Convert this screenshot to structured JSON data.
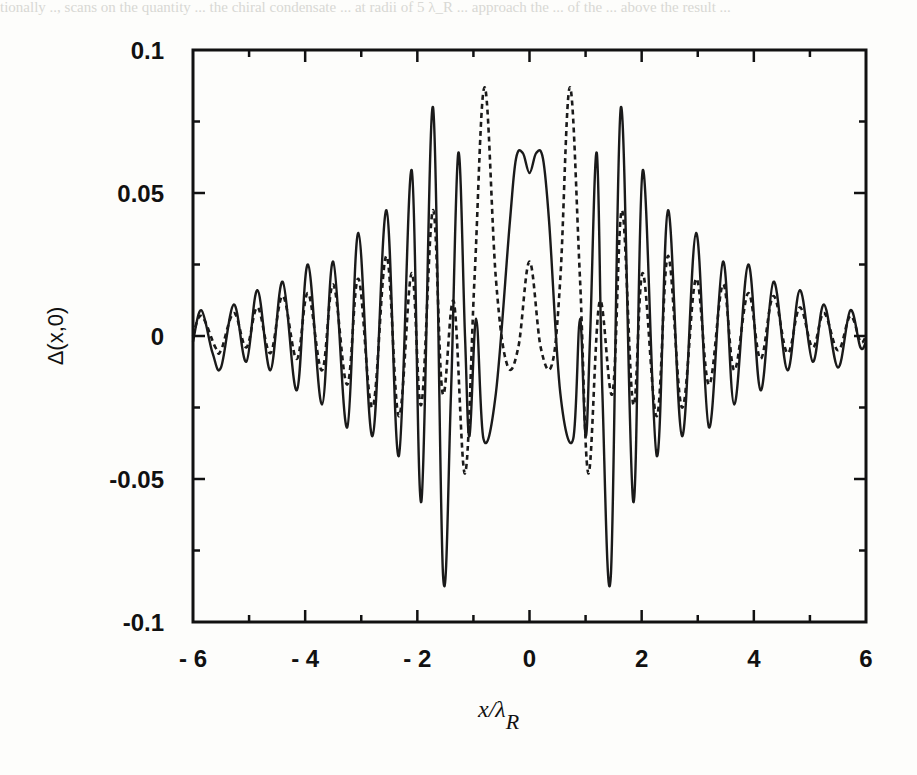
{
  "chart_data": {
    "type": "line",
    "title": "",
    "xlabel": "x/λ_R",
    "ylabel": "Δ(x,0)",
    "xlim": [
      -6,
      6
    ],
    "ylim": [
      -0.1,
      0.1
    ],
    "grid": false,
    "legend": null,
    "x_ticks": {
      "major": [
        -6,
        -4,
        -2,
        0,
        2,
        4,
        6
      ],
      "minor": [
        -5,
        -3,
        -1,
        1,
        3,
        5
      ],
      "labels": [
        "- 6",
        "- 4",
        "- 2",
        "0",
        "2",
        "4",
        "6"
      ]
    },
    "y_ticks": {
      "major": [
        0.1,
        0.05,
        0,
        -0.05,
        -0.1
      ],
      "minor": [
        0.075,
        0.025,
        -0.025,
        -0.075
      ],
      "labels": [
        "0.1",
        "0.05",
        "0",
        "-0.05",
        "-0.1"
      ]
    },
    "series": [
      {
        "name": "solid",
        "style": "solid",
        "points": [
          [
            -6.0,
            -0.002
          ],
          [
            -5.85,
            0.009
          ],
          [
            -5.65,
            -0.006
          ],
          [
            -5.5,
            -0.011
          ],
          [
            -5.27,
            0.011
          ],
          [
            -5.05,
            -0.009
          ],
          [
            -4.85,
            0.016
          ],
          [
            -4.62,
            -0.012
          ],
          [
            -4.4,
            0.019
          ],
          [
            -4.15,
            -0.019
          ],
          [
            -3.95,
            0.025
          ],
          [
            -3.7,
            -0.024
          ],
          [
            -3.5,
            0.026
          ],
          [
            -3.25,
            -0.032
          ],
          [
            -3.05,
            0.036
          ],
          [
            -2.8,
            -0.035
          ],
          [
            -2.55,
            0.044
          ],
          [
            -2.33,
            -0.042
          ],
          [
            -2.1,
            0.058
          ],
          [
            -1.93,
            -0.058
          ],
          [
            -1.72,
            0.08
          ],
          [
            -1.54,
            -0.084
          ],
          [
            -1.4,
            -0.02
          ],
          [
            -1.27,
            0.064
          ],
          [
            -1.15,
            0.0
          ],
          [
            -1.07,
            -0.035
          ],
          [
            -0.95,
            0.006
          ],
          [
            -0.82,
            -0.036
          ],
          [
            -0.6,
            -0.02
          ],
          [
            -0.35,
            0.04
          ],
          [
            -0.24,
            0.062
          ],
          [
            -0.12,
            0.064
          ],
          [
            0.0,
            0.057
          ],
          [
            0.12,
            0.064
          ],
          [
            0.24,
            0.062
          ],
          [
            0.35,
            0.04
          ],
          [
            0.55,
            -0.02
          ],
          [
            0.78,
            -0.036
          ],
          [
            0.9,
            0.006
          ],
          [
            1.0,
            -0.035
          ],
          [
            1.08,
            0.0
          ],
          [
            1.2,
            0.064
          ],
          [
            1.3,
            -0.02
          ],
          [
            1.45,
            -0.084
          ],
          [
            1.63,
            0.08
          ],
          [
            1.85,
            -0.058
          ],
          [
            2.02,
            0.058
          ],
          [
            2.27,
            -0.042
          ],
          [
            2.47,
            0.044
          ],
          [
            2.72,
            -0.035
          ],
          [
            2.97,
            0.036
          ],
          [
            3.2,
            -0.032
          ],
          [
            3.45,
            0.026
          ],
          [
            3.65,
            -0.024
          ],
          [
            3.9,
            0.025
          ],
          [
            4.12,
            -0.019
          ],
          [
            4.35,
            0.019
          ],
          [
            4.6,
            -0.012
          ],
          [
            4.82,
            0.016
          ],
          [
            5.05,
            -0.009
          ],
          [
            5.25,
            0.011
          ],
          [
            5.5,
            -0.011
          ],
          [
            5.72,
            0.009
          ],
          [
            5.9,
            -0.004
          ],
          [
            6.0,
            -0.002
          ]
        ]
      },
      {
        "name": "dashed",
        "style": "dashed",
        "points": [
          [
            -6.0,
            0.0
          ],
          [
            -5.85,
            0.007
          ],
          [
            -5.6,
            -0.004
          ],
          [
            -5.5,
            -0.005
          ],
          [
            -5.27,
            0.008
          ],
          [
            -5.05,
            -0.004
          ],
          [
            -4.85,
            0.01
          ],
          [
            -4.62,
            -0.006
          ],
          [
            -4.4,
            0.014
          ],
          [
            -4.15,
            -0.008
          ],
          [
            -3.95,
            0.015
          ],
          [
            -3.7,
            -0.012
          ],
          [
            -3.5,
            0.018
          ],
          [
            -3.25,
            -0.017
          ],
          [
            -3.05,
            0.02
          ],
          [
            -2.8,
            -0.025
          ],
          [
            -2.55,
            0.028
          ],
          [
            -2.33,
            -0.028
          ],
          [
            -2.1,
            0.022
          ],
          [
            -1.93,
            -0.024
          ],
          [
            -1.72,
            0.044
          ],
          [
            -1.55,
            -0.02
          ],
          [
            -1.35,
            0.012
          ],
          [
            -1.15,
            -0.048
          ],
          [
            -0.98,
            0.02
          ],
          [
            -0.8,
            0.087
          ],
          [
            -0.6,
            0.02
          ],
          [
            -0.4,
            -0.01
          ],
          [
            -0.2,
            -0.004
          ],
          [
            0.0,
            0.026
          ],
          [
            0.2,
            -0.004
          ],
          [
            0.4,
            -0.01
          ],
          [
            0.55,
            0.02
          ],
          [
            0.72,
            0.087
          ],
          [
            0.9,
            0.02
          ],
          [
            1.05,
            -0.048
          ],
          [
            1.25,
            0.012
          ],
          [
            1.48,
            -0.02
          ],
          [
            1.65,
            0.044
          ],
          [
            1.85,
            -0.024
          ],
          [
            2.02,
            0.022
          ],
          [
            2.27,
            -0.028
          ],
          [
            2.47,
            0.028
          ],
          [
            2.72,
            -0.025
          ],
          [
            2.97,
            0.02
          ],
          [
            3.2,
            -0.017
          ],
          [
            3.45,
            0.018
          ],
          [
            3.65,
            -0.012
          ],
          [
            3.9,
            0.015
          ],
          [
            4.12,
            -0.008
          ],
          [
            4.35,
            0.014
          ],
          [
            4.6,
            -0.006
          ],
          [
            4.82,
            0.01
          ],
          [
            5.05,
            -0.004
          ],
          [
            5.25,
            0.008
          ],
          [
            5.5,
            -0.005
          ],
          [
            5.72,
            0.007
          ],
          [
            5.9,
            -0.002
          ],
          [
            6.0,
            0.0
          ]
        ]
      }
    ]
  },
  "figure": {
    "xlabel_main": "x/λ",
    "xlabel_sub": "R",
    "ylabel": "Δ(x,0)"
  },
  "page_bleed_text": "tionally .., scans on the quantity ... the chiral condensate ...\nat radii of 5 λ_R ... approach the ... of the ... above the result ..."
}
